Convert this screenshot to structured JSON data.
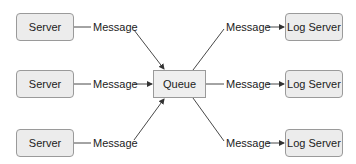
{
  "diagram": {
    "sources": [
      {
        "label": "Server"
      },
      {
        "label": "Server"
      },
      {
        "label": "Server"
      }
    ],
    "incoming_messages": [
      {
        "label": "Message"
      },
      {
        "label": "Message"
      },
      {
        "label": "Message"
      }
    ],
    "queue": {
      "label": "Queue"
    },
    "outgoing_messages": [
      {
        "label": "Message"
      },
      {
        "label": "Message"
      },
      {
        "label": "Message"
      }
    ],
    "sinks": [
      {
        "label": "Log Server"
      },
      {
        "label": "Log Server"
      },
      {
        "label": "Log Server"
      }
    ],
    "colors": {
      "box_fill": "#ececec",
      "box_border": "#9a9a9a",
      "line": "#333333"
    }
  }
}
